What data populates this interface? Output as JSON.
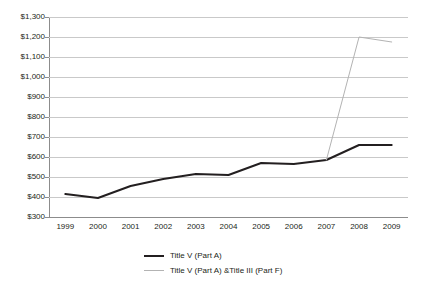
{
  "chart_data": {
    "type": "line",
    "title": "",
    "xlabel": "",
    "ylabel": "",
    "categories": [
      "1999",
      "2000",
      "2001",
      "2002",
      "2003",
      "2004",
      "2005",
      "2006",
      "2007",
      "2008",
      "2009"
    ],
    "ylim": [
      300,
      1300
    ],
    "ytick_step": 100,
    "ytick_labels": [
      "$1,300",
      "$1,200",
      "$1,100",
      "$1,000",
      "$900",
      "$800",
      "$700",
      "$600",
      "$500",
      "$400",
      "$300"
    ],
    "ytick_values": [
      1300,
      1200,
      1100,
      1000,
      900,
      800,
      700,
      600,
      500,
      400,
      300
    ],
    "grid": true,
    "legend_position": "bottom",
    "series": [
      {
        "name": "Title V (Part A)",
        "color": "#231f20",
        "width": 2,
        "values": [
          415,
          395,
          455,
          490,
          515,
          510,
          570,
          565,
          585,
          660,
          660
        ]
      },
      {
        "name": "Title V (Part A) &Title III (Part F)",
        "color": "#b3b3b3",
        "width": 1,
        "values": [
          null,
          null,
          null,
          null,
          null,
          null,
          null,
          null,
          585,
          1200,
          1175
        ]
      }
    ]
  },
  "legend": {
    "items": [
      {
        "label": "Title V (Part A)",
        "swatch": "dark"
      },
      {
        "label": "Title V (Part A) &Title III (Part F)",
        "swatch": "light"
      }
    ]
  }
}
